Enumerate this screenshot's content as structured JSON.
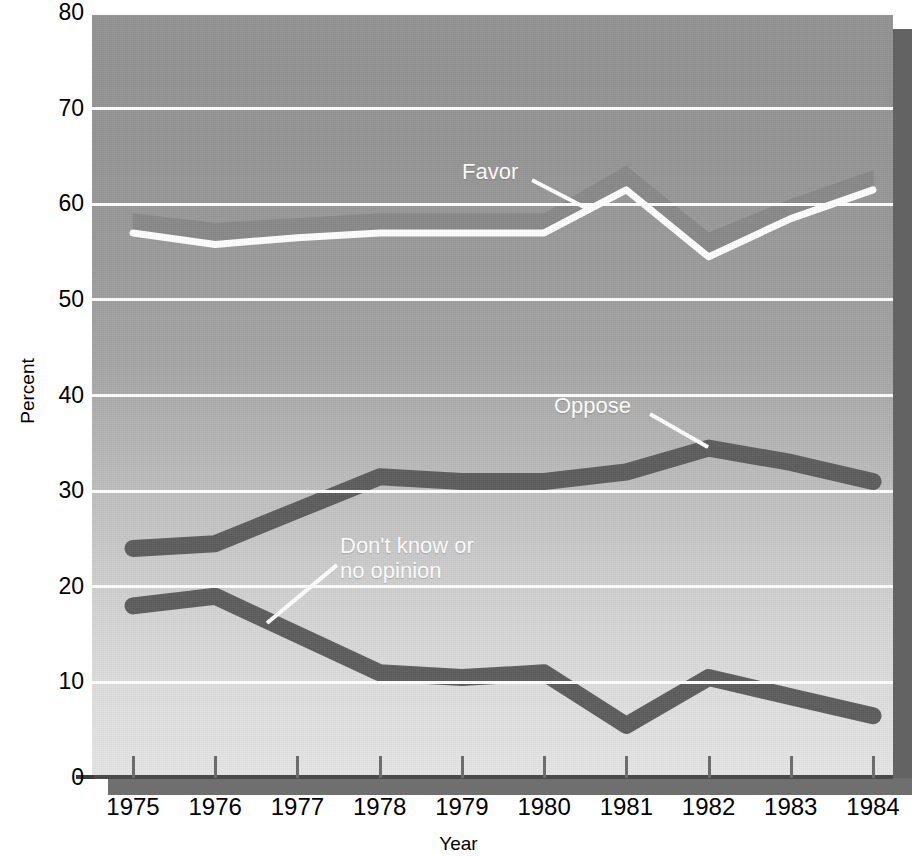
{
  "title": "",
  "chart_data": {
    "type": "line",
    "title": "",
    "xlabel": "Year",
    "ylabel": "Percent",
    "categories": [
      "1975",
      "1976",
      "1977",
      "1978",
      "1979",
      "1980",
      "1981",
      "1982",
      "1983",
      "1984"
    ],
    "x": [
      1975,
      1976,
      1977,
      1978,
      1979,
      1980,
      1981,
      1982,
      1983,
      1984
    ],
    "ylim": [
      0,
      80
    ],
    "yticks": [
      0,
      10,
      20,
      30,
      40,
      50,
      60,
      70,
      80
    ],
    "xlim": [
      1975,
      1984
    ],
    "grid": "horizontal",
    "legend_position": "inline-annotations",
    "series": [
      {
        "name": "Favor",
        "style": "thick-band-light-edge",
        "values": [
          58,
          57,
          57.5,
          58,
          58,
          58,
          63,
          56,
          59.5,
          62.5
        ],
        "upper": [
          59,
          58,
          58.5,
          59,
          59,
          59,
          64,
          57,
          60.5,
          63.5
        ],
        "lower": [
          57,
          55.8,
          56.5,
          57,
          57,
          57,
          61.5,
          54.5,
          58.5,
          61.5
        ]
      },
      {
        "name": "Oppose",
        "style": "thick-band-dark",
        "values": [
          24,
          24.5,
          28,
          31.5,
          31,
          31,
          32,
          34.5,
          33,
          31
        ]
      },
      {
        "name": "Don't know or\nno opinion",
        "style": "thick-band-dark",
        "values": [
          18,
          19,
          15,
          11,
          10.5,
          11,
          5.5,
          10.5,
          8.5,
          6.5
        ]
      }
    ],
    "annotations": [
      {
        "label": "Favor",
        "x": 1979.2,
        "y": 66.5
      },
      {
        "label": "Oppose",
        "x": 1979.5,
        "y": 36.5
      },
      {
        "label": "Don't know or\nno opinion",
        "x": 1976.8,
        "y": 23.5
      }
    ]
  },
  "axes": {
    "y_ticks": [
      "80",
      "70",
      "60",
      "50",
      "40",
      "30",
      "20",
      "10",
      "0"
    ],
    "y_title": "Percent",
    "x_ticks": [
      "1975",
      "1976",
      "1977",
      "1978",
      "1979",
      "1980",
      "1981",
      "1982",
      "1983",
      "1984"
    ],
    "x_title": "Year"
  },
  "annotations": {
    "favor": "Favor",
    "oppose": "Oppose",
    "dont_know_line1": "Don't know or",
    "dont_know_line2": "no opinion"
  },
  "colors": {
    "plot_bg_top": "#949494",
    "plot_bg_bottom": "#e6e6e6",
    "gridline": "#ffffff",
    "favor_band": "#8a8a8a",
    "favor_edge": "#ffffff",
    "oppose_band": "#5e5e5e",
    "dontknow_band": "#5e5e5e",
    "shadow": "#636363",
    "text": "#000000",
    "annotation_text": "#ffffff"
  }
}
